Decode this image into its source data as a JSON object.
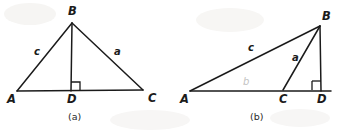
{
  "figure": {
    "background_color": "#ffffff",
    "stroke_color": "#1b1b1b",
    "faint_color": "#c3c3c3",
    "panels": [
      {
        "id": "a",
        "caption": "(a)",
        "caption_pos": {
          "x": 68,
          "y": 112
        },
        "description": "Acute triangle ABC with altitude BD drawn from vertex B perpendicular to base AC, foot at D between A and C",
        "vertices": [
          {
            "name": "A",
            "x": 17,
            "y": 91,
            "label_x": 7,
            "label_y": 94
          },
          {
            "name": "B",
            "x": 72,
            "y": 23,
            "label_x": 68,
            "label_y": 6
          },
          {
            "name": "C",
            "x": 143,
            "y": 90,
            "label_x": 148,
            "label_y": 93
          },
          {
            "name": "D",
            "x": 71,
            "y": 91,
            "label_x": 67,
            "label_y": 94
          }
        ],
        "segments": [
          {
            "name": "side-c",
            "from": "A",
            "to": "B"
          },
          {
            "name": "side-a",
            "from": "B",
            "to": "C"
          },
          {
            "name": "base-AC",
            "from": "A",
            "to": "C"
          },
          {
            "name": "altitude-BD",
            "from": "B",
            "to": "D"
          }
        ],
        "side_labels": [
          {
            "name": "c",
            "text": "c",
            "x": 34,
            "y": 47
          },
          {
            "name": "a",
            "text": "a",
            "x": 114,
            "y": 47
          }
        ],
        "right_angle": {
          "at": "D",
          "size": 9,
          "side": "right",
          "x": 71,
          "y": 82
        }
      },
      {
        "id": "b",
        "caption": "(b)",
        "caption_pos": {
          "x": 250,
          "y": 112
        },
        "description": "Obtuse triangle ABC with altitude BD dropped to the extension of base AC, foot D lying outside segment AC beyond C",
        "vertices": [
          {
            "name": "A",
            "x": 190,
            "y": 91,
            "label_x": 180,
            "label_y": 94
          },
          {
            "name": "B",
            "x": 320,
            "y": 26,
            "label_x": 322,
            "label_y": 11
          },
          {
            "name": "C",
            "x": 283,
            "y": 90,
            "label_x": 279,
            "label_y": 94
          },
          {
            "name": "D",
            "x": 321,
            "y": 91,
            "label_x": 317,
            "label_y": 94
          }
        ],
        "segments": [
          {
            "name": "side-c",
            "from": "A",
            "to": "B"
          },
          {
            "name": "side-a",
            "from": "B",
            "to": "C"
          },
          {
            "name": "base-AD",
            "from": "A",
            "to": "D"
          },
          {
            "name": "altitude-BD",
            "from": "B",
            "to": "D"
          }
        ],
        "side_labels": [
          {
            "name": "c",
            "text": "c",
            "x": 248,
            "y": 43
          },
          {
            "name": "a",
            "text": "a",
            "x": 292,
            "y": 53
          },
          {
            "name": "b",
            "text": "b",
            "x": 243,
            "y": 77,
            "faint": true
          }
        ],
        "right_angle": {
          "at": "D",
          "size": 9,
          "side": "left",
          "x": 312,
          "y": 81
        }
      }
    ]
  }
}
